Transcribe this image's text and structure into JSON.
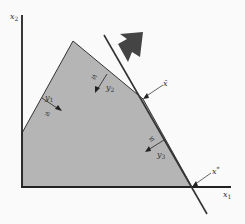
{
  "diagram": {
    "type": "linear-programming-feasible-region",
    "axes": {
      "x_label": "x",
      "x_sub": "1",
      "y_label": "x",
      "y_sub": "2"
    },
    "region": {
      "fill": "#b5b5b5",
      "vertices": [
        [
          22,
          133
        ],
        [
          73,
          41
        ],
        [
          143,
          99
        ],
        [
          192,
          187
        ],
        [
          22,
          187
        ]
      ]
    },
    "constraints": [
      {
        "dual_label": "y",
        "dual_sub": "1",
        "sign": "≤"
      },
      {
        "dual_label": "y",
        "dual_sub": "2",
        "sign": "≤"
      },
      {
        "dual_label": "y",
        "dual_sub": "3",
        "sign": "≤"
      }
    ],
    "points": {
      "x_bar": {
        "label": "x̄"
      },
      "x_star": {
        "label": "x",
        "sup": "*"
      }
    },
    "objective": {
      "arrow_color": "#444444",
      "line_color": "#333333"
    }
  }
}
